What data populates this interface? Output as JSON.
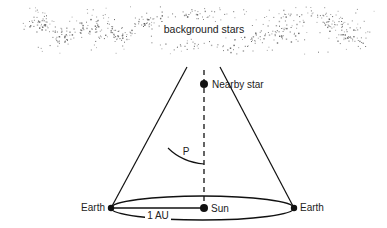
{
  "diagram": {
    "labels": {
      "background_stars": "background stars",
      "nearby_star": "Nearby star",
      "parallax_angle": "P",
      "earth_left": "Earth",
      "earth_right": "Earth",
      "sun": "Sun",
      "distance": "1 AU"
    },
    "colors": {
      "line": "#111111",
      "stars": "#555555",
      "text": "#222222"
    }
  }
}
